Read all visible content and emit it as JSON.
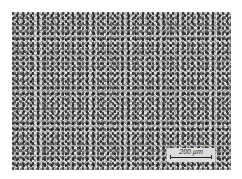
{
  "image": {
    "description": "Grayscale optical micrograph of fine-grained microstructure",
    "colors": {
      "background": "#ffffff",
      "mid_gray": "#bdbdbd",
      "dark_grain": "#1e1e1e"
    }
  },
  "scale_bar": {
    "label": "200 µm"
  }
}
